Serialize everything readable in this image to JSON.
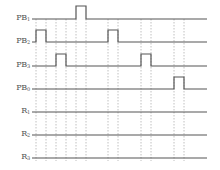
{
  "diagram": {
    "type": "timing-diagram",
    "line_start_x": 32,
    "line_end_x": 207,
    "colors": {
      "signal": "#555555",
      "grid": "#b0b0b0",
      "label": "#555555"
    },
    "time_markers_x": [
      36,
      46,
      56,
      66,
      76,
      86,
      108,
      118,
      141,
      151,
      174,
      184
    ],
    "signals": [
      {
        "name": "PB",
        "sub": "1",
        "baseline_y": 19,
        "high_y": 6,
        "pulses": [
          [
            76,
            86
          ]
        ]
      },
      {
        "name": "PB",
        "sub": "2",
        "baseline_y": 42,
        "high_y": 30,
        "pulses": [
          [
            36,
            46
          ],
          [
            108,
            118
          ]
        ]
      },
      {
        "name": "PB",
        "sub": "3",
        "baseline_y": 66,
        "high_y": 54,
        "pulses": [
          [
            56,
            66
          ],
          [
            141,
            151
          ]
        ]
      },
      {
        "name": "PB",
        "sub": "0",
        "baseline_y": 89,
        "high_y": 77,
        "pulses": [
          [
            174,
            184
          ]
        ]
      },
      {
        "name": "R",
        "sub": "1",
        "baseline_y": 112,
        "high_y": 100,
        "pulses": []
      },
      {
        "name": "R",
        "sub": "2",
        "baseline_y": 135,
        "high_y": 123,
        "pulses": []
      },
      {
        "name": "R",
        "sub": "3",
        "baseline_y": 158,
        "high_y": 146,
        "pulses": []
      }
    ]
  }
}
